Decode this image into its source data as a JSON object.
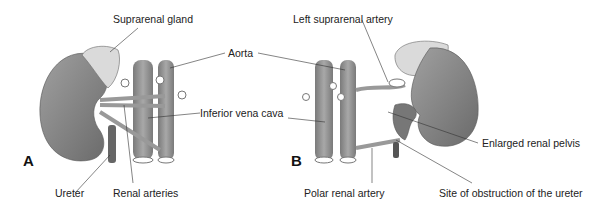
{
  "panels": {
    "a": {
      "letter": "A",
      "labels": {
        "suprarenal_gland": "Suprarenal gland",
        "aorta": "Aorta",
        "inferior_vena_cava": "Inferior vena cava",
        "ureter": "Ureter",
        "renal_arteries": "Renal arteries"
      }
    },
    "b": {
      "letter": "B",
      "labels": {
        "left_suprarenal_artery": "Left suprarenal artery",
        "enlarged_renal_pelvis": "Enlarged renal pelvis",
        "polar_renal_artery": "Polar renal artery",
        "site_of_obstruction": "Site of obstruction of the ureter"
      }
    }
  },
  "colors": {
    "kidney": "#8a8a8a",
    "gland": "#dcdcdc",
    "vessel": "#9a9a9a",
    "line": "#333333"
  }
}
